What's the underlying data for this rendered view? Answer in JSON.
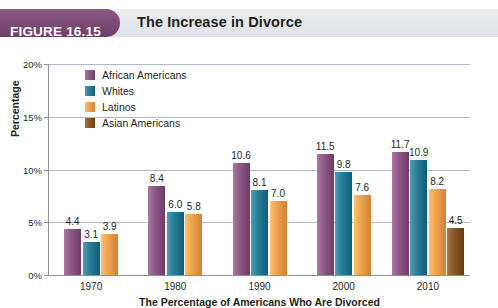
{
  "figure": {
    "badge_label": "FIGURE 16.15",
    "title": "The Increase in Divorce"
  },
  "chart_data": {
    "type": "bar",
    "title": "The Increase in Divorce",
    "xlabel": "The Percentage of Americans Who Are Divorced",
    "ylabel": "Percentage",
    "categories": [
      "1970",
      "1980",
      "1990",
      "2000",
      "2010"
    ],
    "ylim": [
      0,
      20
    ],
    "yticks": [
      0,
      5,
      10,
      15,
      20
    ],
    "ytick_labels": [
      "0%",
      "5%",
      "10%",
      "15%",
      "20%"
    ],
    "grid": true,
    "legend_position": "top-left",
    "series": [
      {
        "name": "African Americans",
        "color": "#8d5b86",
        "values": [
          4.4,
          8.4,
          10.6,
          11.5,
          11.7
        ],
        "labels": [
          "4.4",
          "8.4",
          "10.6",
          "11.5",
          "11.7"
        ]
      },
      {
        "name": "Whites",
        "color": "#2d7e99",
        "values": [
          3.1,
          6.0,
          8.1,
          9.8,
          10.9
        ],
        "labels": [
          "3.1",
          "6.0",
          "8.1",
          "9.8",
          "10.9"
        ]
      },
      {
        "name": "Latinos",
        "color": "#f0a352",
        "values": [
          3.9,
          5.8,
          7.0,
          7.6,
          8.2
        ],
        "labels": [
          "3.9",
          "5.8",
          "7.0",
          "7.6",
          "8.2"
        ]
      },
      {
        "name": "Asian Americans",
        "color": "#8a5a2b",
        "values": [
          null,
          null,
          null,
          null,
          4.5
        ],
        "labels": [
          "",
          "",
          "",
          "",
          "4.5"
        ]
      }
    ]
  },
  "colors": {
    "badge_purple": "#7d4a77",
    "header_gray": "#e4e7eb",
    "gridline": "#aeb9cc",
    "axis": "#8e9298",
    "text": "#1f1f20"
  }
}
